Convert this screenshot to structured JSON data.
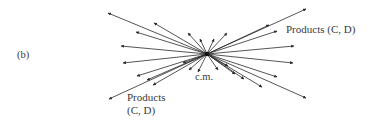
{
  "figure": {
    "panel_label": "(b)",
    "center_label": "c.m.",
    "products_right": "Products (C, D)",
    "products_left_line1": "Products",
    "products_left_line2": "(C, D)",
    "center": [
      207,
      54
    ],
    "arrow_color": "#2a2a2a",
    "arrows": [
      [
        108,
        13
      ],
      [
        154,
        23
      ],
      [
        136,
        32
      ],
      [
        121,
        46
      ],
      [
        123,
        63
      ],
      [
        137,
        76
      ],
      [
        147,
        80
      ],
      [
        153,
        85
      ],
      [
        109,
        99
      ],
      [
        306,
        9
      ],
      [
        269,
        25
      ],
      [
        277,
        31
      ],
      [
        294,
        46
      ],
      [
        293,
        63
      ],
      [
        277,
        77
      ],
      [
        262,
        87
      ],
      [
        306,
        98
      ],
      [
        188,
        33
      ],
      [
        200,
        39
      ],
      [
        214,
        39
      ],
      [
        227,
        33
      ],
      [
        183,
        63
      ],
      [
        189,
        70
      ],
      [
        198,
        72
      ],
      [
        218,
        70
      ],
      [
        228,
        66
      ],
      [
        235,
        74
      ],
      [
        244,
        79
      ]
    ]
  }
}
